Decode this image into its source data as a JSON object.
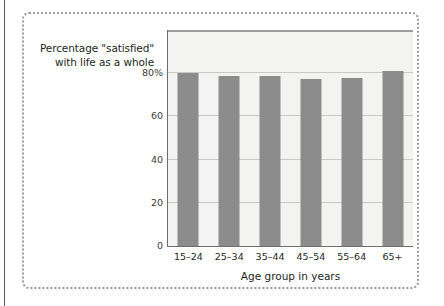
{
  "figure": {
    "border_color": "#9a9a9a",
    "plot_background": "#f3f3f1",
    "bar_color": "#8c8c8c",
    "gridline_color": "#c9c9c7",
    "axis_color": "#6d6d6d"
  },
  "chart_data": {
    "type": "bar",
    "title": "",
    "ylabel_line1": "Percentage \"satisfied\"",
    "ylabel_line2": "with life as a whole",
    "xlabel": "Age group in years",
    "categories": [
      "15–24",
      "25–34",
      "35–44",
      "45–54",
      "55–64",
      "65+"
    ],
    "values": [
      80,
      78.5,
      78.5,
      77.5,
      78,
      81
    ],
    "ylim": [
      0,
      100
    ],
    "yticks": [
      0,
      20,
      40,
      60,
      80
    ],
    "ytick_labels": [
      "0",
      "20",
      "40",
      "60",
      "80%"
    ],
    "grid": true,
    "legend": null
  }
}
